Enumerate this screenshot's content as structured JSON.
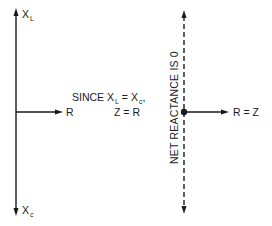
{
  "diagram": {
    "left_axis": {
      "top_label": {
        "main": "X",
        "sub": "L"
      },
      "bottom_label": {
        "main": "X",
        "sub": "c"
      },
      "horizontal_label": "R"
    },
    "middle_text": {
      "line1_prefix": "SINCE X",
      "line1_sub1": "L",
      "line1_mid": " = X",
      "line1_sub2": "c",
      "line1_suffix": ",",
      "line2": "Z = R"
    },
    "right_axis": {
      "vertical_label": "NET REACTANCE IS 0",
      "horizontal_label": "R = Z"
    },
    "colors": {
      "ink": "#1a1a1a",
      "background": "#ffffff"
    }
  }
}
